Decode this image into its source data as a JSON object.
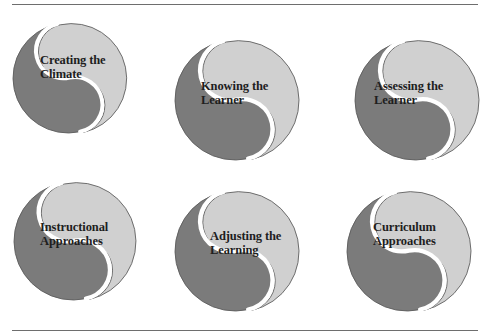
{
  "diagram": {
    "colors": {
      "dark": "#7b7b7b",
      "light": "#d0d0d0",
      "gap": "#ffffff",
      "outline": "#5a5a5a",
      "rule": "#6e6e6e",
      "text": "#1e1e1e"
    },
    "nodes": [
      {
        "id": "creating-the-climate",
        "line1": "Creating the",
        "line2": "Climate",
        "cx": 68,
        "cy": 78,
        "r": 55,
        "label_x": 40,
        "label_y": 54
      },
      {
        "id": "knowing-the-learner",
        "line1": "Knowing the",
        "line2": "Learner",
        "cx": 235,
        "cy": 100,
        "r": 60,
        "label_x": 201,
        "label_y": 80
      },
      {
        "id": "assessing-the-learner",
        "line1": "Assessing the",
        "line2": "Learner",
        "cx": 415,
        "cy": 100,
        "r": 60,
        "label_x": 374,
        "label_y": 80
      },
      {
        "id": "instructional-approaches",
        "line1": "Instructional",
        "line2": "Approaches",
        "cx": 73,
        "cy": 241,
        "r": 59,
        "label_x": 40,
        "label_y": 221
      },
      {
        "id": "adjusting-the-learning",
        "line1": "Adjusting the",
        "line2": "Learning",
        "cx": 235,
        "cy": 251,
        "r": 60,
        "label_x": 210,
        "label_y": 230
      },
      {
        "id": "curriculum-approaches",
        "line1": "Curriculum",
        "line2": "Approaches",
        "cx": 407,
        "cy": 251,
        "r": 60,
        "label_x": 373,
        "label_y": 221
      }
    ]
  }
}
